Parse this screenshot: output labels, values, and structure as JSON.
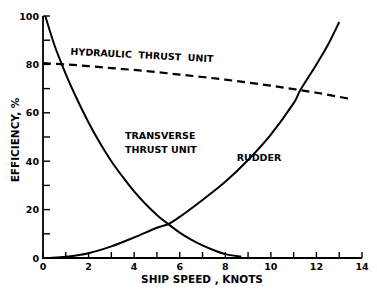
{
  "chart_data": {
    "type": "line",
    "title": "",
    "xlabel": "SHIP SPEED , KNOTS",
    "ylabel": "EFFICIENCY, %",
    "xlim": [
      0,
      14
    ],
    "ylim": [
      0,
      100
    ],
    "x_ticks": [
      0,
      2,
      4,
      6,
      8,
      10,
      12,
      14
    ],
    "y_ticks": [
      0,
      20,
      40,
      60,
      80,
      100
    ],
    "grid": false,
    "series": [
      {
        "name": "HYDRAULIC THRUST UNIT",
        "style": "dashed",
        "x": [
          0,
          1,
          2,
          3,
          4,
          5,
          6,
          7,
          8,
          9,
          10,
          11,
          12,
          13,
          13.5
        ],
        "y": [
          80.5,
          80,
          79.3,
          78.5,
          77.7,
          76.8,
          75.8,
          74.8,
          73.7,
          72.5,
          71.2,
          69.8,
          68.3,
          66.6,
          65.7
        ]
      },
      {
        "name": "TRANSVERSE THRUST UNIT",
        "style": "solid",
        "x": [
          0.1,
          0.5,
          1,
          1.5,
          2,
          2.5,
          3,
          3.5,
          4,
          4.5,
          5,
          5.5,
          6,
          6.5,
          7,
          7.5,
          8,
          8.7
        ],
        "y": [
          100,
          88,
          76,
          65.5,
          56,
          47.5,
          40,
          33.5,
          27.5,
          22.3,
          17.8,
          14,
          10.5,
          7.6,
          5.2,
          3.2,
          1.6,
          0.5
        ]
      },
      {
        "name": "RUDDER",
        "style": "solid",
        "x": [
          0.3,
          1,
          2,
          3,
          4,
          5,
          5.5,
          6,
          7,
          8,
          9,
          10,
          11,
          11.3,
          12,
          12.5,
          13
        ],
        "y": [
          0,
          0.5,
          2,
          4.8,
          8.5,
          12.5,
          14,
          17,
          24,
          31.5,
          40.5,
          51,
          64,
          69.5,
          80,
          88,
          97.5
        ]
      }
    ],
    "annotations": [
      {
        "text": "HYDRAULIC  THRUST  UNIT",
        "x": 1.2,
        "y": 84
      },
      {
        "text": "TRANSVERSE",
        "x": 3.6,
        "y": 49
      },
      {
        "text": "THRUST UNIT",
        "x": 3.6,
        "y": 43.5
      },
      {
        "text": "RUDDER",
        "x": 8.5,
        "y": 40
      }
    ]
  }
}
